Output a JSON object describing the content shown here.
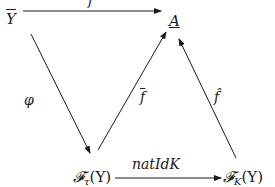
{
  "diagram": {
    "type": "commutative-diagram",
    "nodes": {
      "Y_bar": {
        "symbol": "Y",
        "decoration": "overline"
      },
      "A": {
        "symbol": "A",
        "decoration": "underline"
      },
      "F_tau": {
        "script": "𝓕",
        "sub": "τ",
        "arg": "(Y)"
      },
      "F_K": {
        "script": "𝓕",
        "sub": "K",
        "arg": "(Y)"
      }
    },
    "arrows": {
      "f": {
        "from": "Y_bar",
        "to": "A",
        "label": "f"
      },
      "phi": {
        "from": "Y_bar",
        "to": "F_tau",
        "label": "φ"
      },
      "f_bar": {
        "from": "F_tau",
        "to": "A",
        "label": "f",
        "decoration": "overline"
      },
      "f_hat": {
        "from": "F_K",
        "to": "A",
        "label": "f̂"
      },
      "natIdK": {
        "from": "F_tau",
        "to": "F_K",
        "label": "natIdK"
      }
    },
    "stroke_color": "#1a1a1a",
    "background": "#ffffff"
  }
}
